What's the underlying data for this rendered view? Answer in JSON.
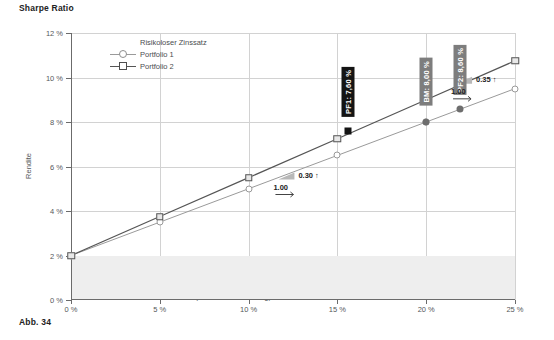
{
  "title": "Sharpe Ratio",
  "caption": "Abb. 34",
  "legend": {
    "items": [
      {
        "label": "Risikoloser Zinssatz",
        "marker": "none"
      },
      {
        "label": "Portfolio 1",
        "marker": "circle"
      },
      {
        "label": "Portfolio 2",
        "marker": "square"
      }
    ]
  },
  "annotations": {
    "pf1_label": "PF1: 7,60 %",
    "bm_label": "BM: 8,00 %",
    "pf2_label": "PF2: 8,60 %",
    "slope1": "0.30",
    "slope1_arrow": "↑",
    "run1": "1.00",
    "slope2": "0.35",
    "slope2_arrow": "↑",
    "run2": "1.00"
  },
  "chart_data": {
    "type": "line",
    "title": "Sharpe Ratio",
    "xlabel": "Risiko (Standardabweichung)",
    "ylabel": "Rendite",
    "xlim": [
      0,
      25
    ],
    "ylim": [
      0,
      12
    ],
    "xticks": [
      0,
      5,
      10,
      15,
      20,
      25
    ],
    "yticks": [
      0,
      2,
      4,
      6,
      8,
      10,
      12
    ],
    "xticklabels": [
      "0 %",
      "5 %",
      "10 %",
      "15 %",
      "20 %",
      "25 %"
    ],
    "yticklabels": [
      "0 %",
      "2 %",
      "4 %",
      "6 %",
      "8 %",
      "10 %",
      "12 %"
    ],
    "grid": true,
    "legend_position": "top-left",
    "risk_free_rate": 2.0,
    "risk_free_band": [
      0,
      2
    ],
    "series": [
      {
        "name": "Portfolio 1",
        "marker": "circle",
        "sharpe_ratio": 0.3,
        "color": "#9a9a9a",
        "x": [
          0,
          5,
          10,
          15,
          20,
          25
        ],
        "values": [
          2.0,
          3.5,
          5.0,
          6.5,
          8.0,
          9.5
        ]
      },
      {
        "name": "Portfolio 2",
        "marker": "square",
        "sharpe_ratio": 0.35,
        "color": "#555555",
        "x": [
          0,
          5,
          10,
          15,
          20,
          25
        ],
        "values": [
          2.0,
          3.75,
          5.5,
          7.25,
          9.0,
          10.75
        ]
      }
    ],
    "points": [
      {
        "name": "PF1",
        "x": 15.6,
        "y": 7.6,
        "label": "PF1: 7,60 %",
        "style": "black-square"
      },
      {
        "name": "BM",
        "x": 20.0,
        "y": 8.0,
        "label": "BM: 8,00 %",
        "style": "grey-dot"
      },
      {
        "name": "PF2",
        "x": 21.9,
        "y": 8.6,
        "label": "PF2: 8,60 %",
        "style": "grey-dot"
      }
    ],
    "slope_annotations": [
      {
        "series": "Portfolio 1",
        "rise": "0.30",
        "run": "1.00",
        "x": 12.3,
        "y": 5.55
      },
      {
        "series": "Portfolio 2",
        "rise": "0.35",
        "run": "1.00",
        "x": 22.3,
        "y": 9.85
      }
    ]
  }
}
